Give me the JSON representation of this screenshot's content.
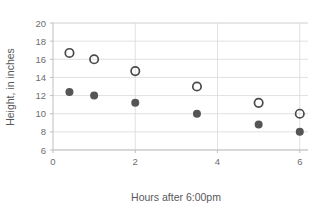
{
  "chart_data": {
    "type": "scatter",
    "title": "",
    "xlabel": "Hours after 6:00pm",
    "ylabel": "Height, in inches",
    "xlim": [
      0,
      6.2
    ],
    "ylim": [
      6,
      20
    ],
    "xticks": [
      "0",
      "2",
      "4",
      "6"
    ],
    "xtick_values": [
      0,
      2,
      4,
      6
    ],
    "yticks": [
      "6",
      "8",
      "10",
      "12",
      "14",
      "16",
      "18",
      "20"
    ],
    "ytick_values": [
      6,
      8,
      10,
      12,
      14,
      16,
      18,
      20
    ],
    "grid": "horizontal-and-vertical",
    "legend": "none",
    "series": [
      {
        "name": "open-circles",
        "marker": "open-circle",
        "color": "#4a4a4c",
        "points": [
          {
            "x": 0.4,
            "y": 16.7
          },
          {
            "x": 1.0,
            "y": 16.0
          },
          {
            "x": 2.0,
            "y": 14.7
          },
          {
            "x": 3.5,
            "y": 13.0
          },
          {
            "x": 5.0,
            "y": 11.2
          },
          {
            "x": 6.0,
            "y": 10.0
          }
        ]
      },
      {
        "name": "filled-circles",
        "marker": "filled-circle",
        "color": "#555557",
        "points": [
          {
            "x": 0.4,
            "y": 12.4
          },
          {
            "x": 1.0,
            "y": 12.0
          },
          {
            "x": 2.0,
            "y": 11.2
          },
          {
            "x": 3.5,
            "y": 10.0
          },
          {
            "x": 5.0,
            "y": 8.8
          },
          {
            "x": 6.0,
            "y": 8.0
          }
        ]
      }
    ]
  }
}
